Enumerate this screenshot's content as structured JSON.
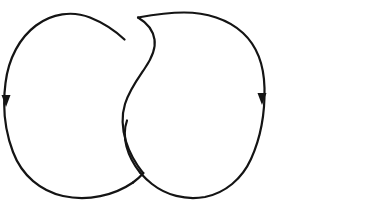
{
  "figure": {
    "name": "hopf-link-diagram",
    "background_color": "#ffffff",
    "ink_color": "#141414",
    "stroke_width": 2.2,
    "canvas": {
      "width": 371,
      "height": 214
    },
    "crossing_count": 2,
    "component_count": 2,
    "has_labels": false,
    "label_text": ""
  },
  "components": [
    {
      "id": "left-loop",
      "name": "left-component",
      "description": "left oriented circle",
      "color": "#141414",
      "bounds": {
        "x": 5,
        "y": 13,
        "width": 142,
        "height": 185
      },
      "orientation": "clockwise",
      "over_at_crossings": [
        "lower-crossing"
      ],
      "under_at_crossings": [
        "upper-crossing"
      ],
      "arrow": {
        "id": "left-arrow",
        "name": "left-orientation-arrow",
        "direction": "down",
        "x": 6,
        "y": 101,
        "size": 9
      },
      "path_over": "M 124.5 39.5 C 116 31.5 105 23.5 90 17.5 C 72 10.5 52 13.5 36 25.5 C 20 37.5 8.5 58 5.5 83 C 2.5 106 5 131 13 152 C 22 176 41 191 63 196 C 88 201.5 114 195.5 133 182.5",
      "path_under_segment": "M 133 182.5 C 137 179.6 140.5 176.4 143.5 173",
      "gap_ranges": [
        {
          "crossing": "upper-crossing",
          "start_t": 0.0,
          "end_t": 0.0
        }
      ]
    },
    {
      "id": "right-loop",
      "name": "right-component",
      "description": "right oriented circle",
      "color": "#141414",
      "bounds": {
        "x": 117,
        "y": 12,
        "width": 148,
        "height": 188
      },
      "orientation": "clockwise",
      "over_at_crossings": [
        "upper-crossing"
      ],
      "under_at_crossings": [
        "lower-crossing"
      ],
      "arrow": {
        "id": "right-arrow",
        "name": "right-orientation-arrow",
        "direction": "down",
        "x": 262,
        "y": 99,
        "size": 9
      },
      "path_over_upper": "M 143 173 C 136 164 129.5 153 126 141.5 C 122 128.5 121.5 115.5 125 104 C 129 90.5 137.5 79 145 68 C 151.5 58.5 156 49 154.5 39.5 C 153 30 146.5 22.5 138 17.5",
      "path_main": "M 138 17.5 C 152 15 168 12.5 184 12.5 C 206 12.5 228 19 243 33 C 257 46 264 66 264.5 88 C 265 112 261 137 251 159 C 242 179 225 193 205 197 C 185 200.5 166 195 152 184 C 147.5 180.5 143.5 176.5 140 172.5",
      "path_under_lower": "M 140 172.5 C 134 165 129 156 126.5 146.5 C 124 136.5 124.5 127.5 127 120.5"
    }
  ],
  "crossings": [
    {
      "id": "upper-crossing",
      "name": "upper-crossing",
      "x": 131,
      "y": 46,
      "over_component": "right-loop",
      "under_component": "left-loop",
      "sign": "positive"
    },
    {
      "id": "lower-crossing",
      "name": "lower-crossing",
      "x": 139,
      "y": 170,
      "over_component": "left-loop",
      "under_component": "right-loop",
      "sign": "positive"
    }
  ]
}
